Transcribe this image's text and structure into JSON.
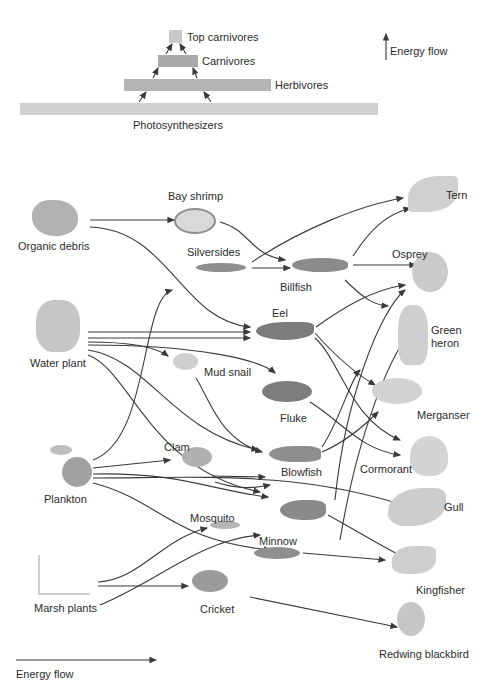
{
  "pyramid": {
    "levels": [
      {
        "label": "Top carnivores",
        "color": "#c9c9c9"
      },
      {
        "label": "Carnivores",
        "color": "#a9a9a9"
      },
      {
        "label": "Herbivores",
        "color": "#b4b4b4"
      },
      {
        "label": "Photosynthesizers",
        "color": "#d0d0d0"
      }
    ],
    "legend": "Energy flow"
  },
  "web": {
    "producers": [
      "Organic debris",
      "Water plant",
      "Plankton",
      "Marsh plants"
    ],
    "primary": [
      "Bay shrimp",
      "Silversides",
      "Mud snail",
      "Clam",
      "Mosquito",
      "Cricket"
    ],
    "secondary": [
      "Billfish",
      "Eel",
      "Fluke",
      "Blowfish",
      "Minnow"
    ],
    "top": [
      "Tern",
      "Osprey",
      "Green",
      "heron",
      "Merganser",
      "Cormorant",
      "Gull",
      "Kingfisher",
      "Redwing blackbird"
    ],
    "legend": "Energy flow"
  },
  "colors": {
    "line": "#3a3a3a",
    "organism": "#9a9a9a",
    "bird": "#c4c4c4"
  }
}
